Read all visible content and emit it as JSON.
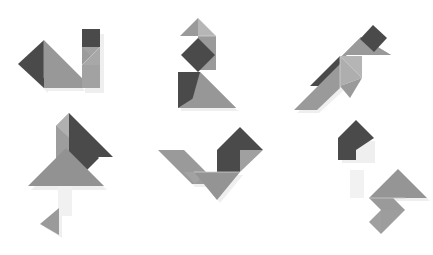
{
  "page": {
    "background": "#ffffff",
    "width": 433,
    "height": 255,
    "layout": "2 rows x 3 columns grid of tangram silhouettes"
  },
  "palette": {
    "dark": "#4a4a4a",
    "mid": "#949494",
    "light": "#a9a9a9",
    "shadow": "#ebebeb",
    "background": "#ffffff"
  },
  "figures": [
    {
      "id": "figure-1",
      "name": "cat-tangram",
      "label": "Cat",
      "row": 1,
      "column": 1,
      "origin": {
        "x": 18,
        "y": 24
      },
      "piece_count": 7,
      "pieces": [
        {
          "name": "small-triangle-head",
          "shape": "triangle",
          "color": "dark",
          "points": "0,40 26,16 26,64"
        },
        {
          "name": "large-triangle-body-upper",
          "shape": "triangle",
          "color": "light",
          "points": "26,16 64,54 26,54"
        },
        {
          "name": "large-triangle-body-lower",
          "shape": "triangle",
          "color": "mid",
          "points": "26,16 26,64 64,64 64,54"
        },
        {
          "name": "square-ear",
          "shape": "square",
          "color": "dark",
          "points": "64,7 81,7 81,24 64,24"
        },
        {
          "name": "medium-triangle-back",
          "shape": "triangle",
          "color": "mid",
          "points": "64,24 81,24 81,41"
        },
        {
          "name": "small-triangle-tail",
          "shape": "triangle",
          "color": "mid",
          "points": "64,24 81,41 64,41"
        },
        {
          "name": "parallelogram-rump",
          "shape": "parallelogram",
          "color": "mid",
          "points": "64,41 81,41 81,64 64,64"
        }
      ]
    },
    {
      "id": "figure-2",
      "name": "swan-tangram",
      "label": "Swan",
      "row": 1,
      "column": 2,
      "origin": {
        "x": 178,
        "y": 18
      },
      "piece_count": 7,
      "pieces": [
        {
          "name": "small-triangle-beak",
          "shape": "triangle",
          "color": "mid",
          "points": "3,17 20,0 20,17"
        },
        {
          "name": "small-triangle-head",
          "shape": "triangle",
          "color": "light",
          "points": "20,0 37,17 20,17"
        },
        {
          "name": "parallelogram-neck",
          "shape": "parallelogram",
          "color": "mid",
          "points": "20,17 37,17 37,50 20,50"
        },
        {
          "name": "square-chest",
          "shape": "square",
          "color": "dark",
          "points": "4,36 20,20 36,36 20,52"
        },
        {
          "name": "small-triangle-wing",
          "shape": "triangle",
          "color": "dark",
          "points": "0,52 20,52 0,72"
        },
        {
          "name": "medium-triangle-body-left",
          "shape": "triangle",
          "color": "dark",
          "points": "0,52 20,72 0,72"
        },
        {
          "name": "large-triangle-body-right",
          "shape": "triangle",
          "color": "mid",
          "points": "20,52 56,88 0,88"
        }
      ]
    },
    {
      "id": "figure-3",
      "name": "flying-bird-tangram",
      "label": "Flying bird",
      "row": 1,
      "column": 3,
      "origin": {
        "x": 296,
        "y": 22
      },
      "piece_count": 7,
      "pieces": [
        {
          "name": "square-head",
          "shape": "square",
          "color": "dark",
          "points": "66,16 78,2 92,15 79,29"
        },
        {
          "name": "small-triangle-beak",
          "shape": "triangle",
          "color": "mid",
          "points": "79,29 92,15 96,31"
        },
        {
          "name": "large-triangle-wing-upper",
          "shape": "triangle",
          "color": "mid",
          "points": "38,43 66,16 84,35 54,35"
        },
        {
          "name": "medium-triangle-wing-dark",
          "shape": "triangle",
          "color": "dark",
          "points": "16,64 45,34 45,64"
        },
        {
          "name": "small-triangle-body",
          "shape": "triangle",
          "color": "light",
          "points": "45,34 66,34 66,56"
        },
        {
          "name": "parallelogram-wing-lower",
          "shape": "parallelogram",
          "color": "mid",
          "points": "0,88 45,43 45,64 21,88"
        },
        {
          "name": "small-triangle-tail",
          "shape": "triangle",
          "color": "mid",
          "points": "45,64 66,56 66,74"
        }
      ]
    },
    {
      "id": "figure-4",
      "name": "rabbit-tangram",
      "label": "Rabbit",
      "row": 2,
      "column": 1,
      "origin": {
        "x": 30,
        "y": 108
      },
      "piece_count": 7,
      "pieces": [
        {
          "name": "small-triangle-ear-left",
          "shape": "triangle",
          "color": "mid",
          "points": "40,3 40,30 27,30"
        },
        {
          "name": "small-triangle-ear-right",
          "shape": "triangle",
          "color": "light",
          "points": "40,3 55,19 40,30"
        },
        {
          "name": "medium-triangle-ear-dark",
          "shape": "triangle",
          "color": "dark",
          "points": "40,3 84,48 40,48"
        },
        {
          "name": "parallelogram-neck",
          "shape": "parallelogram",
          "color": "mid",
          "points": "27,30 40,30 40,58 27,58"
        },
        {
          "name": "square-body",
          "shape": "square",
          "color": "dark",
          "points": "40,48 54,34 70,50 56,65"
        },
        {
          "name": "large-triangle-body",
          "shape": "triangle",
          "color": "mid",
          "points": "0,76 37,38 74,76"
        },
        {
          "name": "small-triangle-foot",
          "shape": "triangle",
          "color": "mid",
          "points": "12,114 30,100 30,125"
        }
      ]
    },
    {
      "id": "figure-5",
      "name": "rooster-tangram",
      "label": "Rooster",
      "row": 2,
      "column": 2,
      "origin": {
        "x": 160,
        "y": 128
      },
      "piece_count": 7,
      "pieces": [
        {
          "name": "medium-triangle-head",
          "shape": "triangle",
          "color": "dark",
          "points": "80,0 103,22 58,22"
        },
        {
          "name": "square-neck",
          "shape": "square",
          "color": "dark",
          "points": "58,22 80,22 80,44 58,44"
        },
        {
          "name": "small-triangle-comb",
          "shape": "triangle",
          "color": "mid",
          "points": "80,22 103,22 80,44"
        },
        {
          "name": "parallelogram-wing",
          "shape": "parallelogram",
          "color": "mid",
          "points": "0,22 24,22 58,56 34,56"
        },
        {
          "name": "small-triangle-wing-tip",
          "shape": "triangle",
          "color": "mid",
          "points": "24,44 46,44 35,56"
        },
        {
          "name": "large-triangle-body",
          "shape": "triangle",
          "color": "mid",
          "points": "34,44 80,44 57,72"
        },
        {
          "name": "medium-triangle-tail",
          "shape": "triangle",
          "color": "mid",
          "points": "58,44 80,44 80,22"
        }
      ]
    },
    {
      "id": "figure-6",
      "name": "bird-on-branch-tangram",
      "label": "Bird",
      "row": 2,
      "column": 3,
      "origin": {
        "x": 324,
        "y": 120
      },
      "piece_count": 7,
      "pieces": [
        {
          "name": "medium-triangle-head",
          "shape": "triangle",
          "color": "dark",
          "points": "17,18 33,2 49,18"
        },
        {
          "name": "square-body-upper",
          "shape": "square",
          "color": "dark",
          "points": "17,18 33,18 33,40 17,40"
        },
        {
          "name": "small-triangle-cap",
          "shape": "triangle",
          "color": "dark",
          "points": "33,18 49,18 33,30"
        },
        {
          "name": "large-triangle-wing",
          "shape": "triangle",
          "color": "mid",
          "points": "46,78 75,49 104,78"
        },
        {
          "name": "parallelogram-tail",
          "shape": "parallelogram",
          "color": "mid",
          "points": "46,78 70,78 58,90 82,90"
        },
        {
          "name": "small-triangle-foot-upper",
          "shape": "triangle",
          "color": "mid",
          "points": "58,90 82,90 58,114"
        },
        {
          "name": "small-triangle-foot-lower",
          "shape": "triangle",
          "color": "mid",
          "points": "58,90 58,114 46,102"
        }
      ]
    }
  ]
}
